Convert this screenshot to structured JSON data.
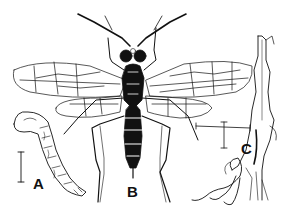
{
  "figure": {
    "background": "#ffffff",
    "ink": "#111111",
    "panels": [
      {
        "id": "A",
        "label": "A",
        "depicts": "larva"
      },
      {
        "id": "B",
        "label": "B",
        "depicts": "adult"
      },
      {
        "id": "C",
        "label": "C",
        "depicts": "damaged stem"
      }
    ],
    "scale_bars": [
      {
        "panel": "A",
        "orientation": "vertical"
      },
      {
        "panel": "C",
        "orientation": "cross"
      }
    ]
  }
}
